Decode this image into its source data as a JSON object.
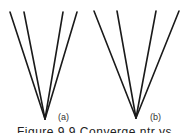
{
  "figure": {
    "panels": [
      {
        "label": "(a)",
        "apex": [
          45,
          119
        ],
        "line_tops": [
          [
            10,
            12
          ],
          [
            24,
            12
          ],
          [
            63,
            12
          ],
          [
            77,
            12
          ]
        ]
      },
      {
        "label": "(b)",
        "apex": [
          136,
          118
        ],
        "line_tops": [
          [
            94,
            11
          ],
          [
            117,
            11
          ],
          [
            156,
            11
          ],
          [
            179,
            11
          ]
        ]
      }
    ],
    "caption": "Figure 9.9  Converge ntr  ys",
    "line_color": "#1a1a1a"
  }
}
